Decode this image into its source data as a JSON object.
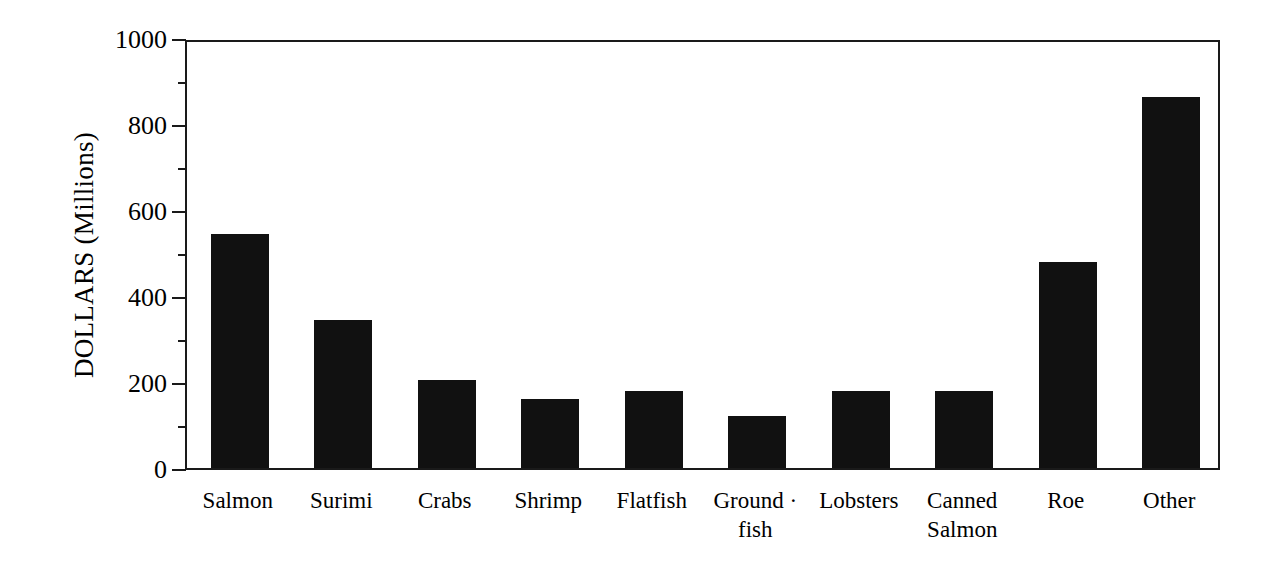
{
  "chart_data": {
    "type": "bar",
    "title": "",
    "xlabel": "",
    "ylabel": "DOLLARS (Millions)",
    "ylim": [
      0,
      1000
    ],
    "ytick_values": [
      0,
      200,
      400,
      600,
      800,
      1000
    ],
    "ytick_labels": [
      "0",
      "200",
      "400",
      "600",
      "800",
      "1000"
    ],
    "yminor_values": [
      100,
      300,
      500,
      700,
      900
    ],
    "grid": false,
    "legend": null,
    "bar_color": "#111111",
    "axis_color": "#1a1a1a",
    "categories": [
      "Salmon",
      "Surimi",
      "Crabs",
      "Shrimp",
      "Flatfish",
      "Ground fish",
      "Lobsters",
      "Canned Salmon",
      "Roe",
      "Other"
    ],
    "category_lines": [
      [
        "Salmon"
      ],
      [
        "Surimi"
      ],
      [
        "Crabs"
      ],
      [
        "Shrimp"
      ],
      [
        "Flatfish"
      ],
      [
        "Ground ·",
        "fish"
      ],
      [
        "Lobsters"
      ],
      [
        "Canned",
        "Salmon"
      ],
      [
        "Roe"
      ],
      [
        "Other"
      ]
    ],
    "values": [
      544,
      344,
      205,
      160,
      178,
      120,
      178,
      178,
      480,
      862
    ]
  },
  "bars": [
    {
      "label": "Salmon",
      "value": 544,
      "line1": "Salmon",
      "line2": ""
    },
    {
      "label": "Surimi",
      "value": 344,
      "line1": "Surimi",
      "line2": ""
    },
    {
      "label": "Crabs",
      "value": 205,
      "line1": "Crabs",
      "line2": ""
    },
    {
      "label": "Shrimp",
      "value": 160,
      "line1": "Shrimp",
      "line2": ""
    },
    {
      "label": "Flatfish",
      "value": 178,
      "line1": "Flatfish",
      "line2": ""
    },
    {
      "label": "Ground fish",
      "value": 120,
      "line1": "Ground ·",
      "line2": "fish"
    },
    {
      "label": "Lobsters",
      "value": 178,
      "line1": "Lobsters",
      "line2": ""
    },
    {
      "label": "Canned Salmon",
      "value": 178,
      "line1": "Canned",
      "line2": "Salmon"
    },
    {
      "label": "Roe",
      "value": 480,
      "line1": "Roe",
      "line2": ""
    },
    {
      "label": "Other",
      "value": 862,
      "line1": "Other",
      "line2": ""
    }
  ],
  "yaxis": {
    "ticks": [
      {
        "label": "1000",
        "value": 1000
      },
      {
        "label": "800",
        "value": 800
      },
      {
        "label": "600",
        "value": 600
      },
      {
        "label": "400",
        "value": 400
      },
      {
        "label": "200",
        "value": 200
      },
      {
        "label": "0",
        "value": 0
      }
    ],
    "title": "DOLLARS (Millions)"
  }
}
